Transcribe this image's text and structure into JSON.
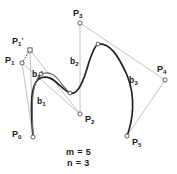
{
  "figure": {
    "title_text": "",
    "colors": {
      "curve": "#222222",
      "curve_alt": "#555555",
      "polygon": "#b0b0b0",
      "point_stroke": "#555555",
      "point_fill": "#ffffff",
      "label": "#1a1a1a",
      "background": "#ffffff"
    },
    "parameters": [
      {
        "name": "m",
        "label": "m = 5",
        "value": 5
      },
      {
        "name": "n",
        "label": "n = 3",
        "value": 3
      }
    ],
    "control_points": [
      {
        "id": "P0",
        "base": "P",
        "sub": "0",
        "prime": "",
        "label": "P0",
        "x": 33,
        "y": 137
      },
      {
        "id": "P1",
        "base": "P",
        "sub": "1",
        "prime": "",
        "label": "P1",
        "x": 22,
        "y": 63
      },
      {
        "id": "P1p",
        "base": "P",
        "sub": "1",
        "prime": "'",
        "label": "P1'",
        "x": 30,
        "y": 50
      },
      {
        "id": "P2",
        "base": "P",
        "sub": "2",
        "prime": "",
        "label": "P2",
        "x": 80,
        "y": 114
      },
      {
        "id": "P3",
        "base": "P",
        "sub": "3",
        "prime": "",
        "label": "P3",
        "x": 80,
        "y": 23
      },
      {
        "id": "P4",
        "base": "P",
        "sub": "4",
        "prime": "",
        "label": "P4",
        "x": 165,
        "y": 80
      },
      {
        "id": "P5",
        "base": "P",
        "sub": "5",
        "prime": "",
        "label": "P5",
        "x": 127,
        "y": 136
      }
    ],
    "knot_points": [
      {
        "id": "k1",
        "x": 41,
        "y": 74
      },
      {
        "id": "k2",
        "x": 70,
        "y": 93
      },
      {
        "id": "k3",
        "x": 98,
        "y": 44
      }
    ],
    "segments": [
      {
        "id": "b1",
        "base": "b",
        "sub": "1",
        "prime": "",
        "label": "b1"
      },
      {
        "id": "b1p",
        "base": "b",
        "sub": "1",
        "prime": "'",
        "label": "b1'"
      },
      {
        "id": "b2",
        "base": "b",
        "sub": "2",
        "prime": "",
        "label": "b2"
      },
      {
        "id": "b3",
        "base": "b",
        "sub": "3",
        "prime": "",
        "label": "b3"
      }
    ]
  }
}
